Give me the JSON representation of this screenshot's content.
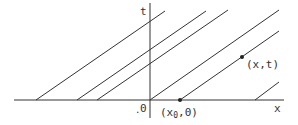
{
  "diagram": {
    "axes": {
      "x_label": "x",
      "t_label": "t",
      "origin_label": "0",
      "origin_dot": "."
    },
    "points": {
      "base_point_label_prefix": "(x",
      "base_point_label_sub": "0",
      "base_point_label_suffix": ",0)",
      "field_point_label": "(x,t)"
    },
    "lines": [
      {
        "x0": 36,
        "y0": 100,
        "x1": 165,
        "y1": 11
      },
      {
        "x0": 77,
        "y0": 100,
        "x1": 206,
        "y1": 11
      },
      {
        "x0": 97,
        "y0": 100,
        "x1": 228,
        "y1": 10
      },
      {
        "x0": 150,
        "y0": 100,
        "x1": 279,
        "y1": 10
      },
      {
        "x0": 180,
        "y0": 100,
        "x1": 279,
        "y1": 31
      },
      {
        "x0": 255,
        "y0": 100,
        "x1": 279,
        "y1": 82
      }
    ],
    "colors": {
      "ink": "#333333",
      "background": "#ffffff"
    }
  }
}
